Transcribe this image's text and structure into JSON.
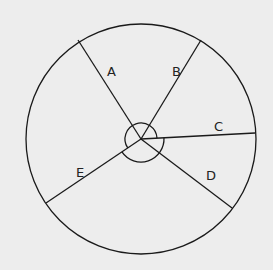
{
  "diagram": {
    "type": "circle divided into five sectors by radii with angle arcs at center",
    "background_color": "#ededed",
    "stroke_color": "#1a1a1a",
    "circle": {
      "cx": 141,
      "cy": 139,
      "r": 115
    },
    "radii": [
      {
        "label": "A",
        "end": [
          78,
          40
        ],
        "label_pos": [
          107,
          76
        ]
      },
      {
        "label": "B",
        "end": [
          201,
          40
        ],
        "label_pos": [
          172,
          76
        ]
      },
      {
        "label": "C",
        "end": [
          255,
          133
        ],
        "label_pos": [
          214,
          131
        ]
      },
      {
        "label": "D",
        "end": [
          232,
          208
        ],
        "label_pos": [
          206,
          180
        ]
      },
      {
        "label": "E",
        "end": [
          46,
          203
        ],
        "label_pos": [
          76,
          177
        ]
      }
    ],
    "angle_arcs": [
      {
        "name": "small-arc",
        "r": 16,
        "from": "E",
        "to": "C",
        "direction": "through top"
      },
      {
        "name": "large-arc",
        "r": 23,
        "from": "C",
        "to": "E",
        "direction": "through bottom"
      }
    ]
  }
}
